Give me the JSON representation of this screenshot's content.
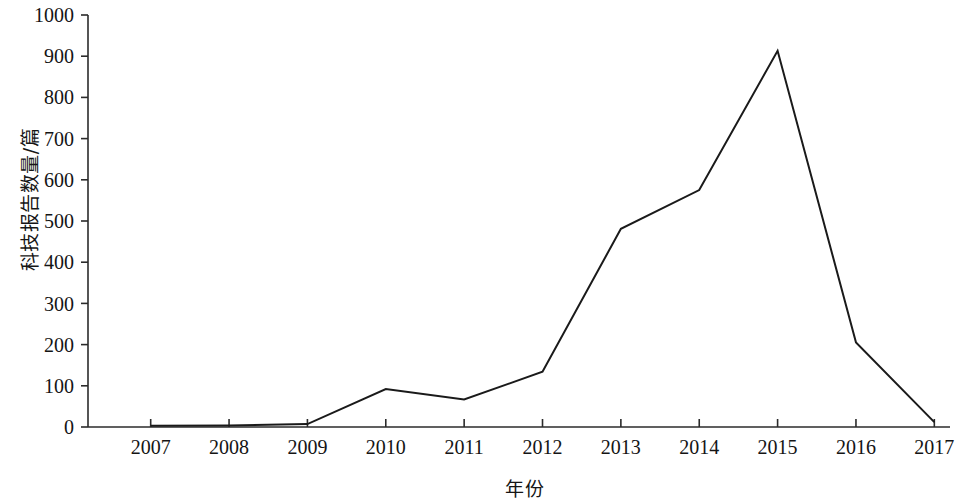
{
  "chart_data": {
    "type": "line",
    "title": "",
    "subtitle": "",
    "xlabel": "年份",
    "ylabel": "科技报告数量/篇",
    "categories": [
      "2007",
      "2008",
      "2009",
      "2010",
      "2011",
      "2012",
      "2013",
      "2014",
      "2015",
      "2016",
      "2017"
    ],
    "x": [
      2007,
      2008,
      2009,
      2010,
      2011,
      2012,
      2013,
      2014,
      2015,
      2016,
      2017
    ],
    "values": [
      3,
      4,
      7,
      92,
      67,
      134,
      481,
      575,
      913,
      205,
      12
    ],
    "series": [
      {
        "name": "科技报告数量",
        "values": [
          3,
          4,
          7,
          92,
          67,
          134,
          481,
          575,
          913,
          205,
          12
        ]
      }
    ],
    "ylim": [
      0,
      1000
    ],
    "ytick_values": [
      0,
      100,
      200,
      300,
      400,
      500,
      600,
      700,
      800,
      900,
      1000
    ],
    "ytick_labels": [
      "0",
      "100",
      "200",
      "300",
      "400",
      "500",
      "600",
      "700",
      "800",
      "900",
      "1000"
    ],
    "xtick_labels": [
      "2007",
      "2008",
      "2009",
      "2010",
      "2011",
      "2012",
      "2013",
      "2014",
      "2015",
      "2016",
      "2017"
    ],
    "grid": false,
    "legend": false,
    "legend_position": "none",
    "line_color": "#1a1a1a",
    "line_width": 2,
    "markers": false,
    "annotations": []
  },
  "axes": {
    "y_title": "科技报告数量/篇",
    "x_title": "年份"
  }
}
